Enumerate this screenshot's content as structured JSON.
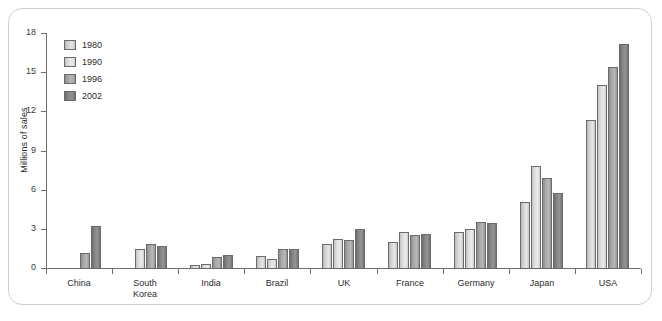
{
  "chart_data": {
    "type": "bar",
    "title": "",
    "xlabel": "",
    "ylabel": "Millions of sales",
    "ylim": [
      0,
      18
    ],
    "yticks": [
      0,
      3,
      6,
      9,
      12,
      15,
      18
    ],
    "grid": false,
    "legend_position": "top-left",
    "categories": [
      "China",
      "South\nKorea",
      "India",
      "Brazil",
      "UK",
      "France",
      "Germany",
      "Japan",
      "USA"
    ],
    "series": [
      {
        "name": "1980",
        "color": "#d9d9d9",
        "values": [
          0,
          0,
          0.3,
          1.0,
          1.9,
          2.1,
          2.8,
          5.1,
          11.4
        ]
      },
      {
        "name": "1990",
        "color": "#e3e3e3",
        "values": [
          0,
          1.5,
          0.4,
          0.75,
          2.3,
          2.8,
          3.1,
          7.9,
          14.1
        ]
      },
      {
        "name": "1996",
        "color": "#ababab",
        "values": [
          1.2,
          1.9,
          0.9,
          1.5,
          2.2,
          2.6,
          3.6,
          7.0,
          15.5
        ]
      },
      {
        "name": "2002",
        "color": "#888888",
        "values": [
          3.3,
          1.8,
          1.1,
          1.5,
          3.1,
          2.7,
          3.5,
          5.8,
          17.2
        ]
      }
    ]
  },
  "legend": {
    "items": [
      {
        "label": "1980"
      },
      {
        "label": "1990"
      },
      {
        "label": "1996"
      },
      {
        "label": "2002"
      }
    ]
  },
  "axis": {
    "y_title": "Millions of sales",
    "y_labels": [
      "18",
      "15",
      "12",
      "9",
      "6",
      "3",
      "0"
    ]
  }
}
